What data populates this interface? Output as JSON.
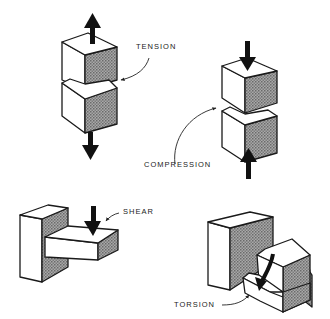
{
  "figure": {
    "panels": [
      {
        "id": "tension",
        "label": "TENSION",
        "description": "Two stacked cubes pulled apart; arrows point away (up on top cube, down on bottom cube)"
      },
      {
        "id": "compression",
        "label": "COMPRESSION",
        "description": "Two stacked cubes pushed together; arrows point toward each other (down on top cube, up on bottom cube)"
      },
      {
        "id": "shear",
        "label": "SHEAR",
        "description": "Beam cantilevered from a wall with a downward force near the wall"
      },
      {
        "id": "torsion",
        "label": "TORSION",
        "description": "Stepped block attached to a wall with a curved twisting arrow"
      }
    ]
  },
  "colors": {
    "line": "#1a1a1a",
    "shade_dark": "#6e6e6e",
    "shade_light": "#b5b5b5",
    "background": "#ffffff"
  }
}
